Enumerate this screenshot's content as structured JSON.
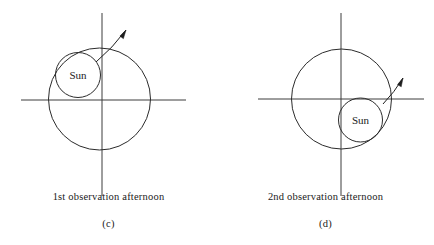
{
  "figure": {
    "type": "diagram",
    "background_color": "#ffffff",
    "line_color": "#2b2b2b",
    "axis_color": "#3c3c3c",
    "canvas": {
      "width": 434,
      "height": 245
    }
  },
  "panels": [
    {
      "id": "c",
      "figure_label": "(c)",
      "caption": "1st observation afternoon",
      "sun_label": "Sun",
      "axes": {
        "horizontal": {
          "x1": 21,
          "y1": 100,
          "x2": 186,
          "y2": 100
        },
        "vertical": {
          "x1": 102,
          "y1": 13,
          "x2": 102,
          "y2": 196
        },
        "origin_x": 102,
        "origin_y": 100
      },
      "orbit_circle": {
        "cx": 99.5,
        "cy": 99,
        "r": 51
      },
      "sun_circle": {
        "cx": 78,
        "cy": 75,
        "r": 22.5
      },
      "sun_label_pos": {
        "x": 78,
        "y": 79
      },
      "arrow": {
        "tail_x": 96,
        "tail_y": 62,
        "tip_x": 126,
        "tip_y": 30,
        "head_angle_deg": -47
      }
    },
    {
      "id": "d",
      "figure_label": "(d)",
      "caption": "2nd observation afternoon",
      "sun_label": "Sun",
      "axes": {
        "horizontal": {
          "x1": 258,
          "y1": 99,
          "x2": 424,
          "y2": 99
        },
        "vertical": {
          "x1": 341,
          "y1": 13,
          "x2": 341,
          "y2": 196
        },
        "origin_x": 341,
        "origin_y": 99
      },
      "orbit_circle": {
        "cx": 341.5,
        "cy": 99,
        "r": 50
      },
      "sun_circle": {
        "cx": 360.5,
        "cy": 120,
        "r": 22
      },
      "sun_label_pos": {
        "x": 360.5,
        "y": 124
      },
      "arrow": {
        "tail_x": 383,
        "tail_y": 104,
        "tip_x": 403,
        "tip_y": 78,
        "head_angle_deg": -52
      }
    }
  ]
}
